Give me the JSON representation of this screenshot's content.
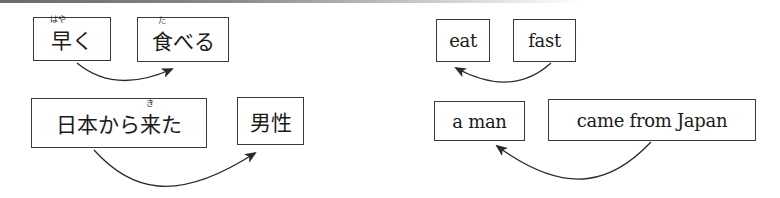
{
  "diagram": {
    "japanese": {
      "row1": {
        "modifier": {
          "text": "早く",
          "ruby": "はや",
          "ruby_on": "早"
        },
        "head": {
          "text": "食べる",
          "ruby": "た",
          "ruby_on": "食"
        },
        "arrow_direction": "modifier -> head (left to right)"
      },
      "row2": {
        "modifier": {
          "text": "日本から来た",
          "ruby": "き",
          "ruby_on": "来"
        },
        "head": {
          "text": "男性"
        },
        "arrow_direction": "modifier -> head (left to right)"
      }
    },
    "english": {
      "row1": {
        "head": {
          "text": "eat"
        },
        "modifier": {
          "text": "fast"
        },
        "arrow_direction": "modifier -> head (right to left)"
      },
      "row2": {
        "head": {
          "text": "a man"
        },
        "modifier": {
          "text": "came from Japan"
        },
        "arrow_direction": "modifier -> head (right to left)"
      }
    },
    "colors": {
      "box_border": "#3a3a3a",
      "arrow": "#2a2a2a",
      "text": "#1a1a1a"
    }
  },
  "jp1a": {
    "pre": "",
    "ruby": "はや",
    "base": "早",
    "post": "く"
  },
  "jp1b": {
    "pre": "",
    "ruby": "た",
    "base": "食",
    "post": "べる"
  },
  "jp2a": {
    "pre": "日本から",
    "ruby": "き",
    "base": "来",
    "post": "た"
  },
  "jp2b": {
    "text": "男性"
  },
  "en1a": {
    "text": "eat"
  },
  "en1b": {
    "text": "fast"
  },
  "en2a": {
    "text": "a man"
  },
  "en2b": {
    "text": "came from Japan"
  }
}
